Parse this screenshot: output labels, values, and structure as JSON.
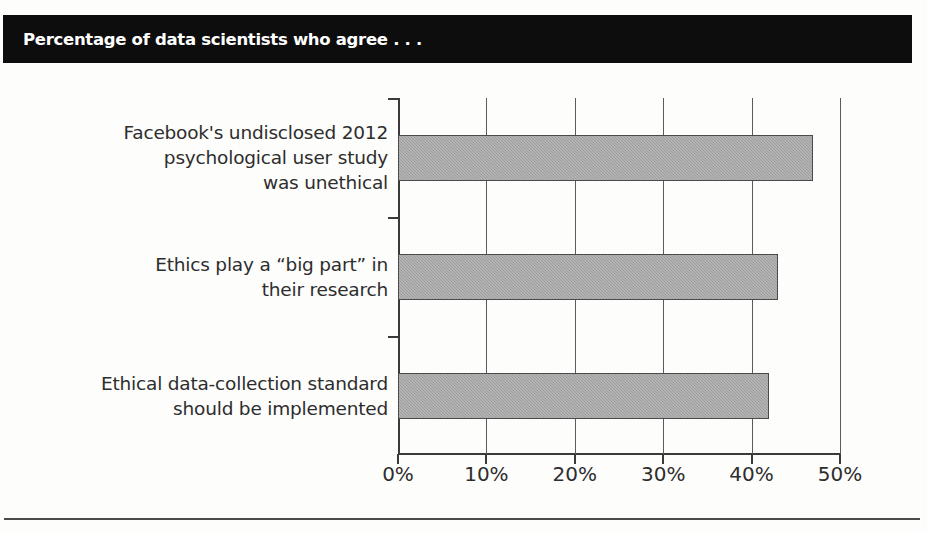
{
  "header": {
    "title": "Percentage of data scientists who agree . . .",
    "background_color": "#0d0d0d",
    "text_color": "#ffffff"
  },
  "chart_data": {
    "type": "bar",
    "orientation": "horizontal",
    "title": "Percentage of data scientists who agree . . .",
    "subtitle": "",
    "xlabel": "",
    "ylabel": "",
    "xlim": [
      0,
      50
    ],
    "ylim": null,
    "grid": true,
    "legend": false,
    "legend_position": "none",
    "bar_color": "#9d9d9d",
    "bar_edge_color": "#4a4a4a",
    "categories": [
      "Facebook's undisclosed 2012 psychological user study was unethical",
      "Ethics play a \"big part\" in their research",
      "Ethical data-collection standard should be implemented"
    ],
    "category_lines": [
      [
        "Facebook's undisclosed 2012",
        "psychological user study",
        "was unethical"
      ],
      [
        "Ethics play a “big part” in",
        "their research"
      ],
      [
        "Ethical data-collection standard",
        "should be implemented"
      ]
    ],
    "values": [
      47,
      43,
      42
    ],
    "value_unit": "%",
    "xticks": [
      0,
      10,
      20,
      30,
      40,
      50
    ],
    "xticklabels": [
      "0%",
      "10%",
      "20%",
      "30%",
      "40%",
      "50%"
    ]
  }
}
